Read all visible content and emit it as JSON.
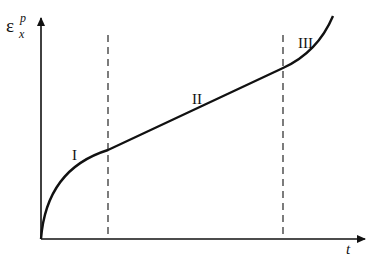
{
  "diagram": {
    "y_axis": {
      "symbol": "ε",
      "superscript": "p",
      "subscript": "x"
    },
    "x_axis": {
      "symbol": "t"
    },
    "stages": [
      {
        "label": "I",
        "name": "primary"
      },
      {
        "label": "II",
        "name": "secondary"
      },
      {
        "label": "III",
        "name": "tertiary"
      }
    ],
    "colors": {
      "line": "#111111",
      "background": "#ffffff"
    }
  }
}
